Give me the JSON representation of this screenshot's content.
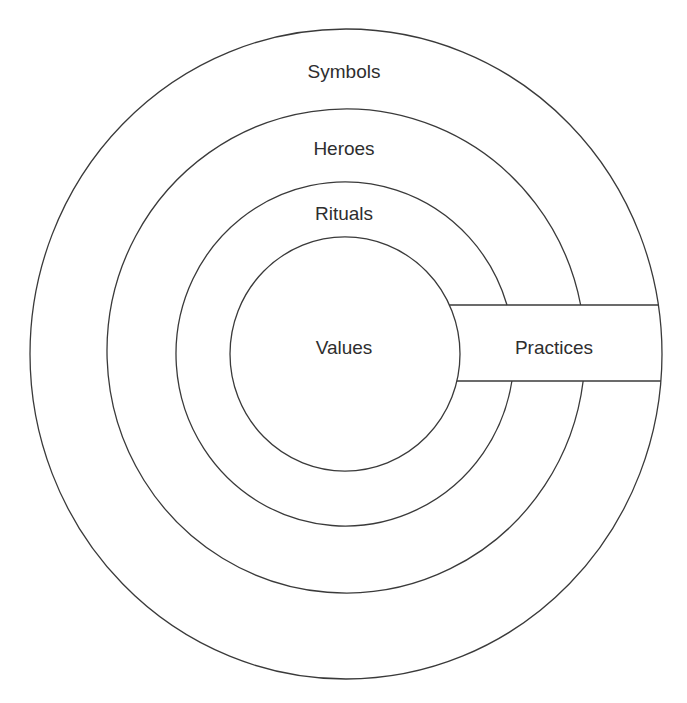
{
  "diagram": {
    "type": "onion-model",
    "layers": [
      {
        "id": "symbols",
        "label": "Symbols",
        "cx": 346,
        "cy": 354,
        "rx": 316,
        "ry": 325,
        "label_x": 344,
        "label_y": 62
      },
      {
        "id": "heroes",
        "label": "Heroes",
        "cx": 346,
        "cy": 351,
        "rx": 239,
        "ry": 242,
        "label_x": 344,
        "label_y": 139
      },
      {
        "id": "rituals",
        "label": "Rituals",
        "cx": 345,
        "cy": 354,
        "rx": 169,
        "ry": 172,
        "label_x": 344,
        "label_y": 204
      },
      {
        "id": "values",
        "label": "Values",
        "cx": 345,
        "cy": 354,
        "rx": 115,
        "ry": 117,
        "label_x": 344,
        "label_y": 338
      }
    ],
    "practices_band": {
      "label": "Practices",
      "top_y": 305,
      "bottom_y": 381,
      "label_x": 554,
      "label_y": 338
    },
    "colors": {
      "line": "#3a3a3a",
      "text": "#2e2e2e",
      "background": "#ffffff"
    }
  }
}
